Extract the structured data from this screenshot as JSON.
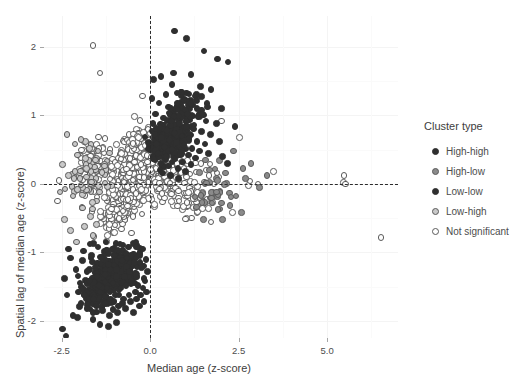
{
  "chart_data": {
    "type": "scatter",
    "title": "",
    "xlabel": "Median age (z-score)",
    "ylabel": "Spatial lag of median age (z-score)",
    "xlim": [
      -3.0,
      7.0
    ],
    "ylim": [
      -2.25,
      2.45
    ],
    "xticks": [
      -2.5,
      0.0,
      2.5,
      5.0
    ],
    "xticklabels": [
      "-2.5",
      "0.0",
      "2.5",
      "5.0"
    ],
    "yticks": [
      2,
      1,
      0,
      -1,
      -2
    ],
    "yticklabels": [
      "2",
      "1",
      "0",
      "-1",
      "-2"
    ],
    "grid": true,
    "legend_position": "right",
    "reference_lines": [
      {
        "axis": "vertical",
        "value": 0.0,
        "style": "dashed"
      },
      {
        "axis": "horizontal",
        "value": 0.0,
        "style": "dashed"
      }
    ],
    "series": [
      {
        "name": "High-high",
        "marker": "filled-circle",
        "color": "#2f2f2f",
        "points": [
          [
            0.68,
            2.23
          ],
          [
            1.02,
            2.12
          ],
          [
            1.52,
            1.94
          ],
          [
            1.9,
            1.82
          ],
          [
            2.2,
            1.78
          ],
          [
            0.3,
            1.57
          ],
          [
            0.62,
            1.45
          ],
          [
            1.15,
            1.6
          ],
          [
            1.42,
            1.42
          ],
          [
            1.72,
            1.38
          ],
          [
            0.1,
            1.52
          ],
          [
            0.45,
            1.3
          ],
          [
            0.88,
            1.34
          ],
          [
            1.3,
            1.22
          ],
          [
            1.62,
            1.12
          ],
          [
            0.05,
            1.25
          ],
          [
            0.25,
            1.18
          ],
          [
            0.52,
            1.12
          ],
          [
            0.78,
            1.08
          ],
          [
            1.05,
            1.02
          ],
          [
            1.35,
            0.98
          ],
          [
            1.58,
            0.92
          ],
          [
            1.88,
            0.88
          ],
          [
            2.4,
            0.84
          ],
          [
            0.15,
            1.02
          ],
          [
            0.38,
            0.96
          ],
          [
            0.6,
            0.92
          ],
          [
            0.82,
            0.88
          ],
          [
            1.02,
            0.84
          ],
          [
            1.22,
            0.8
          ],
          [
            1.45,
            0.76
          ],
          [
            1.7,
            0.72
          ],
          [
            0.08,
            0.88
          ],
          [
            0.28,
            0.82
          ],
          [
            0.48,
            0.78
          ],
          [
            0.68,
            0.74
          ],
          [
            0.9,
            0.7
          ],
          [
            1.1,
            0.66
          ],
          [
            1.32,
            0.62
          ],
          [
            1.55,
            0.58
          ],
          [
            0.12,
            0.72
          ],
          [
            0.32,
            0.68
          ],
          [
            0.55,
            0.64
          ],
          [
            0.75,
            0.6
          ],
          [
            0.95,
            0.56
          ],
          [
            1.18,
            0.52
          ],
          [
            1.4,
            0.48
          ],
          [
            1.65,
            0.44
          ],
          [
            0.18,
            0.58
          ],
          [
            0.4,
            0.54
          ],
          [
            0.62,
            0.5
          ],
          [
            0.85,
            0.46
          ],
          [
            1.08,
            0.42
          ],
          [
            1.28,
            0.38
          ],
          [
            0.22,
            0.44
          ],
          [
            0.45,
            0.4
          ],
          [
            0.7,
            0.36
          ],
          [
            0.92,
            0.32
          ],
          [
            1.15,
            0.28
          ],
          [
            0.3,
            0.3
          ],
          [
            0.52,
            0.26
          ],
          [
            0.78,
            0.22
          ],
          [
            1.0,
            0.18
          ],
          [
            0.35,
            0.16
          ],
          [
            0.58,
            0.12
          ],
          [
            0.8,
            0.08
          ],
          [
            1.95,
            0.62
          ],
          [
            2.05,
            0.4
          ],
          [
            2.18,
            0.3
          ],
          [
            0.96,
            1.22
          ],
          [
            1.48,
            1.02
          ],
          [
            0.66,
            1.62
          ],
          [
            2.02,
            1.1
          ]
        ]
      },
      {
        "name": "High-low",
        "marker": "open-circle",
        "color": "#8a8a8a",
        "points": [
          [
            2.35,
            0.48
          ],
          [
            2.62,
            0.22
          ],
          [
            2.12,
            0.16
          ],
          [
            1.88,
            -0.12
          ],
          [
            2.42,
            -0.18
          ],
          [
            2.85,
            0.3
          ],
          [
            3.08,
            -0.05
          ],
          [
            2.25,
            -0.32
          ],
          [
            1.75,
            -0.28
          ],
          [
            2.58,
            -0.42
          ],
          [
            1.95,
            0.34
          ],
          [
            2.7,
            0.08
          ],
          [
            1.68,
            0.2
          ],
          [
            2.05,
            -0.52
          ],
          [
            3.3,
            0.12
          ]
        ]
      },
      {
        "name": "Low-low",
        "marker": "filled-circle",
        "color": "#2f2f2f",
        "points": [
          [
            -2.42,
            -1.38
          ],
          [
            -2.35,
            -1.62
          ],
          [
            -2.18,
            -1.92
          ],
          [
            -2.05,
            -1.95
          ],
          [
            -1.92,
            -1.12
          ],
          [
            -1.78,
            -1.28
          ],
          [
            -1.65,
            -1.05
          ],
          [
            -1.55,
            -1.22
          ],
          [
            -1.45,
            -1.48
          ],
          [
            -1.38,
            -1.08
          ],
          [
            -1.28,
            -1.32
          ],
          [
            -1.18,
            -1.18
          ],
          [
            -1.1,
            -1.42
          ],
          [
            -1.02,
            -1.05
          ],
          [
            -0.95,
            -1.25
          ],
          [
            -0.88,
            -1.55
          ],
          [
            -0.8,
            -1.12
          ],
          [
            -0.72,
            -1.35
          ],
          [
            -0.65,
            -1.08
          ],
          [
            -0.58,
            -1.28
          ],
          [
            -0.5,
            -1.45
          ],
          [
            -0.45,
            -1.15
          ],
          [
            -0.38,
            -1.32
          ],
          [
            -0.3,
            -1.05
          ],
          [
            -0.25,
            -1.22
          ],
          [
            -0.18,
            -1.38
          ],
          [
            -0.12,
            -1.1
          ],
          [
            -0.08,
            -1.28
          ],
          [
            -2.1,
            -1.25
          ],
          [
            -1.98,
            -1.45
          ],
          [
            -1.85,
            -1.62
          ],
          [
            -1.72,
            -1.42
          ],
          [
            -1.6,
            -1.68
          ],
          [
            -1.5,
            -1.35
          ],
          [
            -1.42,
            -1.58
          ],
          [
            -1.32,
            -1.72
          ],
          [
            -1.22,
            -1.52
          ],
          [
            -1.12,
            -1.68
          ],
          [
            -1.05,
            -1.45
          ],
          [
            -0.98,
            -1.62
          ],
          [
            -0.9,
            -1.78
          ],
          [
            -0.82,
            -1.52
          ],
          [
            -0.75,
            -1.68
          ],
          [
            -0.68,
            -1.48
          ],
          [
            -0.6,
            -1.62
          ],
          [
            -0.52,
            -1.42
          ],
          [
            -0.42,
            -1.58
          ],
          [
            -0.35,
            -1.48
          ],
          [
            -0.28,
            -1.62
          ],
          [
            -0.2,
            -1.52
          ],
          [
            -0.15,
            -1.42
          ],
          [
            -2.25,
            -1.08
          ],
          [
            -2.3,
            -0.95
          ],
          [
            -1.88,
            -0.98
          ],
          [
            -1.7,
            -0.88
          ],
          [
            -1.48,
            -0.92
          ],
          [
            -1.25,
            -0.85
          ],
          [
            -1.08,
            -0.95
          ],
          [
            -0.85,
            -0.88
          ],
          [
            -0.62,
            -0.92
          ],
          [
            -0.4,
            -0.85
          ],
          [
            -0.22,
            -0.95
          ],
          [
            -1.62,
            -1.88
          ],
          [
            -1.35,
            -1.85
          ],
          [
            -1.15,
            -1.92
          ],
          [
            -0.92,
            -1.88
          ],
          [
            -0.7,
            -1.82
          ],
          [
            -0.48,
            -1.88
          ],
          [
            -0.3,
            -1.78
          ],
          [
            -1.95,
            -1.75
          ],
          [
            -1.78,
            -1.82
          ],
          [
            -2.02,
            -1.58
          ],
          [
            -1.52,
            -1.78
          ],
          [
            -1.28,
            -1.75
          ],
          [
            -1.02,
            -1.72
          ],
          [
            -0.78,
            -1.75
          ],
          [
            -0.55,
            -1.72
          ],
          [
            -0.38,
            -1.68
          ],
          [
            -0.18,
            -1.72
          ],
          [
            -0.1,
            -1.58
          ],
          [
            -1.42,
            -2.05
          ],
          [
            -1.18,
            -2.08
          ],
          [
            -0.95,
            -2.02
          ],
          [
            -2.48,
            -2.12
          ],
          [
            -2.38,
            -2.22
          ]
        ]
      },
      {
        "name": "Low-high",
        "marker": "open-circle",
        "color": "#b5b5b5",
        "points": [
          [
            -2.48,
            0.28
          ],
          [
            -2.3,
            0.12
          ],
          [
            -2.18,
            -0.18
          ],
          [
            -2.05,
            0.42
          ],
          [
            -1.92,
            -0.35
          ],
          [
            -1.8,
            0.22
          ],
          [
            -1.68,
            -0.48
          ],
          [
            -1.55,
            0.35
          ],
          [
            -2.42,
            -0.52
          ],
          [
            -2.25,
            -0.68
          ],
          [
            -2.12,
            0.58
          ],
          [
            -1.98,
            0.08
          ],
          [
            -2.35,
            0.72
          ],
          [
            -1.85,
            -0.62
          ],
          [
            -1.72,
            0.52
          ],
          [
            -2.55,
            -0.12
          ],
          [
            -1.62,
            -0.75
          ],
          [
            -1.48,
            0.48
          ],
          [
            -2.08,
            -0.85
          ],
          [
            -1.95,
            0.65
          ]
        ]
      },
      {
        "name": "Not significant",
        "marker": "open-circle",
        "color": "#ffffff",
        "density_note": "Large dense cloud centred near (-0.3, 0.2) spanning roughly x in [-2.6, 3.4], y in [-1.3, 1.5]",
        "points": [
          [
            -1.62,
            2.02
          ],
          [
            -1.42,
            1.62
          ],
          [
            -0.22,
            1.28
          ],
          [
            -0.45,
            0.98
          ],
          [
            2.02,
            0.92
          ],
          [
            2.52,
            0.68
          ],
          [
            2.78,
            -0.02
          ],
          [
            2.82,
            0.04
          ],
          [
            3.05,
            0.0
          ],
          [
            2.32,
            -0.42
          ],
          [
            5.48,
            0.12
          ],
          [
            5.46,
            0.02
          ],
          [
            5.52,
            0.0
          ],
          [
            6.52,
            -0.78
          ],
          [
            3.48,
            0.18
          ],
          [
            -2.62,
            -0.25
          ],
          [
            -2.58,
            0.05
          ]
        ]
      }
    ]
  },
  "axes": {
    "x": {
      "title": "Median age (z-score)",
      "ticks": [
        {
          "label": "-2.5",
          "value": -2.5
        },
        {
          "label": "0.0",
          "value": 0.0
        },
        {
          "label": "2.5",
          "value": 2.5
        },
        {
          "label": "5.0",
          "value": 5.0
        }
      ]
    },
    "y": {
      "title": "Spatial lag of median age (z-score)",
      "ticks": [
        {
          "label": "2",
          "value": 2
        },
        {
          "label": "1",
          "value": 1
        },
        {
          "label": "0",
          "value": 0
        },
        {
          "label": "-1",
          "value": -1
        },
        {
          "label": "-2",
          "value": -2
        }
      ]
    }
  },
  "legend": {
    "title": "Cluster type",
    "items": [
      {
        "label": "High-high",
        "fill": "#2f2f2f",
        "stroke": "#2f2f2f",
        "filled": true
      },
      {
        "label": "High-low",
        "fill": "#8a8a8a",
        "stroke": "#5a5a5a",
        "filled": false
      },
      {
        "label": "Low-low",
        "fill": "#2f2f2f",
        "stroke": "#2f2f2f",
        "filled": true
      },
      {
        "label": "Low-high",
        "fill": "#c9c9c9",
        "stroke": "#5a5a5a",
        "filled": false
      },
      {
        "label": "Not significant",
        "fill": "#ffffff",
        "stroke": "#5a5a5a",
        "filled": false
      }
    ]
  },
  "colors": {
    "panel_background": "#ffffff",
    "grid_major": "#f4f4f4",
    "grid_minor": "#fafafa",
    "reference_line": "#2b2b2b",
    "text": "#4d4d4d"
  },
  "top_sliver": {
    "left_text": "",
    "right_text": ""
  }
}
